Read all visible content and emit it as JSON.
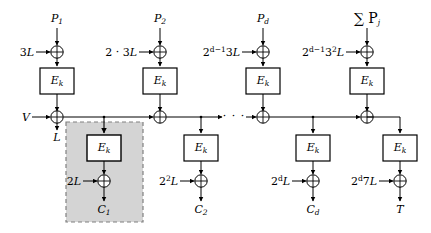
{
  "diagram": {
    "block_cipher_label": "E",
    "block_cipher_sub": "k",
    "colors": {
      "line": "#000000",
      "shaded_region_fill": "#d4d4d4",
      "shaded_region_border": "#666666",
      "background": "#ffffff"
    },
    "plaintext_inputs": [
      {
        "name": "P-1",
        "base": "P",
        "sub": "1"
      },
      {
        "name": "P-2",
        "base": "P",
        "sub": "2"
      },
      {
        "name": "P-d",
        "base": "P",
        "sub": "d"
      },
      {
        "name": "sum-P-j",
        "base": "∑ P",
        "sub": "j"
      }
    ],
    "top_offsets": [
      {
        "name": "offset-3L",
        "text": "3L"
      },
      {
        "name": "offset-2-3L",
        "text": "2 · 3L"
      },
      {
        "name": "offset-2dm1-3L",
        "text": "2",
        "sup": "d−1",
        "tail": "3L"
      },
      {
        "name": "offset-2dm1-32L",
        "text": "2",
        "sup": "d−1",
        "tail": "3",
        "tail_sup": "2",
        "tail2": "L"
      }
    ],
    "bottom_offsets": [
      {
        "name": "offset-2L",
        "text": "2L"
      },
      {
        "name": "offset-22L",
        "text": "2",
        "sup": "2",
        "tail": "L"
      },
      {
        "name": "offset-2dL",
        "text": "2",
        "sup": "d",
        "tail": "L"
      },
      {
        "name": "offset-2d7L",
        "text": "2",
        "sup": "d",
        "tail": "7L"
      }
    ],
    "outputs": [
      {
        "name": "C-1",
        "base": "C",
        "sub": "1"
      },
      {
        "name": "C-2",
        "base": "C",
        "sub": "2"
      },
      {
        "name": "C-d",
        "base": "C",
        "sub": "d"
      },
      {
        "name": "T",
        "base": "T",
        "sub": ""
      }
    ],
    "checksum_input": {
      "name": "V",
      "text": "V"
    },
    "chain_label": {
      "name": "L",
      "text": "L"
    },
    "ellipsis": "· · ·",
    "xor_symbol": "⊕",
    "columns_x": [
      57,
      160,
      263,
      367
    ],
    "lower_columns_x": [
      104,
      201,
      313,
      400
    ],
    "rows": {
      "plaintext_y": 20,
      "top_xor_y": 52,
      "top_cipher_y": 81,
      "chain_y": 117,
      "lower_cipher_y": 148,
      "lower_xor_y": 181,
      "output_y": 209
    }
  }
}
